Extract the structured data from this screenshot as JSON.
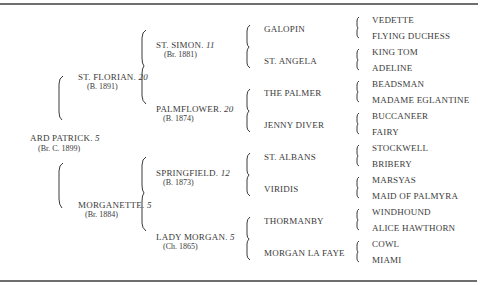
{
  "pedigree": {
    "horse": {
      "name": "ARD PATRICK",
      "num": "5",
      "info": "(Br. C. 1899)"
    },
    "parents": [
      {
        "name": "ST. FLORIAN",
        "num": "20",
        "info": "(B. 1891)"
      },
      {
        "name": "MORGANETTE",
        "num": "5",
        "info": "(Br. 1884)"
      }
    ],
    "grandparents": [
      {
        "name": "ST. SIMON",
        "num": "11",
        "info": "(Br. 1881)"
      },
      {
        "name": "PALMFLOWER",
        "num": "20",
        "info": "(B. 1874)"
      },
      {
        "name": "SPRINGFIELD",
        "num": "12",
        "info": "(B. 1873)"
      },
      {
        "name": "LADY MORGAN",
        "num": "5",
        "info": "(Ch. 1865)"
      }
    ],
    "great_grandparents": [
      "GALOPIN",
      "ST. ANGELA",
      "THE PALMER",
      "JENNY DIVER",
      "ST. ALBANS",
      "VIRIDIS",
      "THORMANBY",
      "MORGAN LA FAYE"
    ],
    "great_great_grandparents": [
      "VEDETTE",
      "FLYING DUCHESS",
      "KING TOM",
      "ADELINE",
      "BEADSMAN",
      "MADAME EGLANTINE",
      "BUCCANEER",
      "FAIRY",
      "STOCKWELL",
      "BRIBERY",
      "MARSYAS",
      "MAID OF PALMYRA",
      "WINDHOUND",
      "ALICE HAWTHORN",
      "COWL",
      "MIAMI"
    ]
  }
}
